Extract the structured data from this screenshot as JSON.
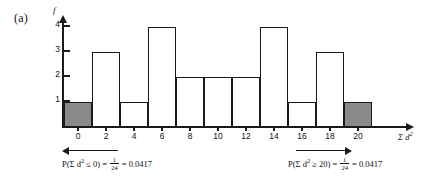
{
  "panel": {
    "label": "(a)"
  },
  "chart_data": {
    "type": "bar",
    "title": "",
    "subtitle": "",
    "xlabel": "Σ d²",
    "ylabel": "f",
    "categories": [
      "0",
      "2",
      "4",
      "6",
      "8",
      "10",
      "12",
      "14",
      "16",
      "18",
      "20"
    ],
    "values": [
      1,
      3,
      1,
      4,
      2,
      2,
      2,
      4,
      1,
      3,
      1
    ],
    "bar_fill": [
      "shaded",
      "open",
      "open",
      "open",
      "open",
      "open",
      "open",
      "open",
      "open",
      "open",
      "shaded"
    ],
    "xlim": [
      -1,
      21
    ],
    "ylim": [
      0,
      4
    ],
    "ytick_labels": [
      "1",
      "2",
      "3",
      "4"
    ],
    "ytick_values": [
      1,
      2,
      3,
      4
    ],
    "grid": false,
    "legend": "none",
    "colors": {
      "shaded_bar": "#8a8a8a",
      "bar_outline": "#1a1a1a",
      "axis": "#1a1a1a",
      "background": "#ffffff",
      "text": "#111111"
    }
  },
  "annotations": {
    "left": {
      "arrow_direction": "left",
      "expression_prefix": "P(Σ d",
      "expression_sup": "2",
      "expression_middle": " ≤ 0) = ",
      "fraction_numerator": "1",
      "fraction_denominator": "24",
      "expression_suffix": " = 0.0417"
    },
    "right": {
      "arrow_direction": "right",
      "expression_prefix": "P(Σ d",
      "expression_sup": "2",
      "expression_middle": " ≥ 20) = ",
      "fraction_numerator": "1",
      "fraction_denominator": "24",
      "expression_suffix": " = 0.0417"
    }
  }
}
